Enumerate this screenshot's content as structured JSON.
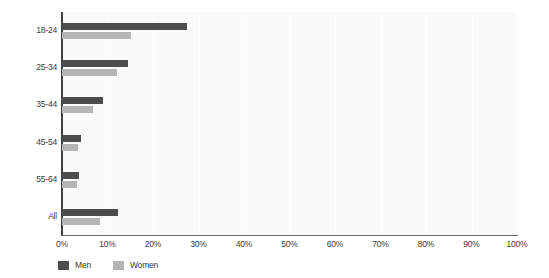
{
  "chart_data": {
    "type": "bar",
    "orientation": "horizontal",
    "title": "",
    "xlabel": "",
    "ylabel": "",
    "categories": [
      "18-24",
      "25-34",
      "35-44",
      "45-54",
      "55-64",
      "All"
    ],
    "series": [
      {
        "name": "Men",
        "color": "#4d4d4d",
        "values": [
          27.5,
          14.5,
          9.0,
          4.2,
          3.8,
          12.3
        ]
      },
      {
        "name": "Women",
        "color": "#b5b5b5",
        "values": [
          15.2,
          12.0,
          6.8,
          3.5,
          3.2,
          8.4
        ]
      }
    ],
    "xlim": [
      0,
      100
    ],
    "x_tick_values": [
      0,
      10,
      20,
      30,
      40,
      50,
      60,
      70,
      80,
      90,
      100
    ],
    "x_tick_labels": [
      "0%",
      "10%",
      "20%",
      "30%",
      "40%",
      "50%",
      "60%",
      "70%",
      "80%",
      "90%",
      "100%"
    ],
    "grid": true,
    "grid_axis": "x",
    "legend_position": "bottom-left",
    "plot_background": "#fafafa",
    "figure_background": "#ffffff",
    "value_unit": "percent"
  },
  "legend": {
    "items": [
      {
        "label": "Men",
        "color": "#4d4d4d"
      },
      {
        "label": "Women",
        "color": "#b5b5b5"
      }
    ]
  }
}
